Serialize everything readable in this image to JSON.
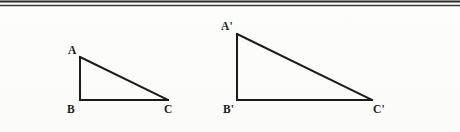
{
  "figure": {
    "background_color": "#fdfdfb",
    "ink_color": "#1b1b1b",
    "top_rule": {
      "name": "double-horizontal-rule",
      "line_count": 2,
      "color": "#2a2a2a"
    },
    "triangles": [
      {
        "id": "ABC",
        "name": "triangle-abc",
        "right_angle_at": "B",
        "vertices": [
          {
            "label": "A",
            "x": 80,
            "y": 57
          },
          {
            "label": "B",
            "x": 80,
            "y": 100
          },
          {
            "label": "C",
            "x": 168,
            "y": 100
          }
        ],
        "labels": {
          "a": "A",
          "b": "B",
          "c": "C"
        }
      },
      {
        "id": "A'B'C'",
        "name": "triangle-a-prime-b-prime-c-prime",
        "right_angle_at": "B'",
        "vertices": [
          {
            "label": "A'",
            "x": 237,
            "y": 34
          },
          {
            "label": "B'",
            "x": 237,
            "y": 100
          },
          {
            "label": "C'",
            "x": 372,
            "y": 100
          }
        ],
        "labels": {
          "a": "A'",
          "b": "B'",
          "c": "C'"
        }
      }
    ]
  }
}
